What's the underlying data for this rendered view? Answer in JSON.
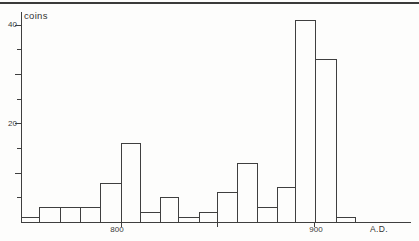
{
  "labels": {
    "ylabel": "coins",
    "xlabel": "A.D.",
    "ytick_40": "40",
    "ytick_20": "20",
    "xtick_800": "800",
    "xtick_900": "900"
  },
  "chart_data": {
    "type": "bar",
    "title": "",
    "ylabel": "coins",
    "xlabel": "A.D.",
    "bin_start_years": [
      750,
      760,
      770,
      780,
      790,
      800,
      810,
      820,
      830,
      840,
      850,
      860,
      870,
      880,
      890,
      900,
      910
    ],
    "bin_width_years": 10,
    "values": [
      1,
      3,
      3,
      3,
      8,
      16,
      2,
      5,
      1,
      2,
      6,
      12,
      3,
      7,
      41,
      33,
      1
    ],
    "ylim": [
      0,
      42
    ],
    "y_tick_step": 5,
    "y_ticks_labeled": [
      20,
      40
    ],
    "x_ticks": [
      800,
      850,
      900
    ],
    "x_ticks_labeled": [
      800,
      900
    ],
    "grid": false,
    "legend": null,
    "bar_style": "outline",
    "line_color": "#3f3f3f",
    "background": "#fdfdfc"
  }
}
